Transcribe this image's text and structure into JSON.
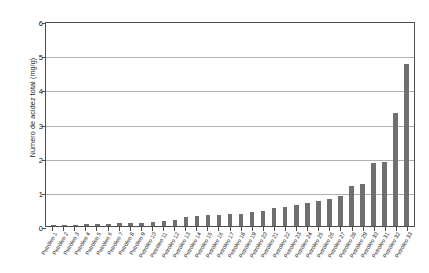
{
  "chart_data": {
    "type": "bar",
    "title": "",
    "xlabel": "",
    "ylabel": "Número de acidez total (mg/g)",
    "ylim": [
      0,
      6
    ],
    "yticks": [
      0,
      1,
      2,
      3,
      4,
      5,
      6
    ],
    "ytick_labels": [
      "0",
      "1",
      "2",
      "3",
      "4",
      "5",
      "6"
    ],
    "grid": true,
    "legend": false,
    "bar_color": "#706f6f",
    "categories": [
      "Petróleo 1",
      "Petróleo 2",
      "Petróleo 3",
      "Petróleo 4",
      "Petróleo 5",
      "Petróleo 6",
      "Petróleo 7",
      "Petróleo 8",
      "Petróleo 9",
      "Petróleo 10",
      "Petróleo 11",
      "Petróleo 12",
      "Petróleo 13",
      "Petróleo 14",
      "Petróleo 15",
      "Petróleo 16",
      "Petróleo 17",
      "Petróleo 18",
      "Petróleo 19",
      "Petróleo 20",
      "Petróleo 21",
      "Petróleo 22",
      "Petróleo 23",
      "Petróleo 24",
      "Petróleo 25",
      "Petróleo 26",
      "Petróleo 27",
      "Petróleo 28",
      "Petróleo 29",
      "Petróleo 30",
      "Petróleo 31",
      "Petróleo 32",
      "Petróleo 33"
    ],
    "values": [
      0.02,
      0.03,
      0.04,
      0.05,
      0.06,
      0.07,
      0.08,
      0.09,
      0.1,
      0.12,
      0.14,
      0.17,
      0.26,
      0.3,
      0.32,
      0.33,
      0.34,
      0.36,
      0.4,
      0.45,
      0.52,
      0.57,
      0.62,
      0.66,
      0.72,
      0.8,
      0.88,
      1.18,
      1.22,
      1.85,
      1.87,
      3.3,
      4.73
    ]
  }
}
